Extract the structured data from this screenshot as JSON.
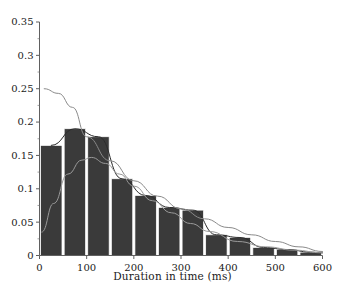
{
  "chart_data": {
    "type": "bar",
    "title": "",
    "xlabel": "Duration in time (ms)",
    "ylabel": "",
    "xlim": [
      0,
      600
    ],
    "ylim": [
      0,
      0.35
    ],
    "grid": false,
    "legend": null,
    "bin_width": 50,
    "x_ticks": [
      0,
      100,
      200,
      300,
      400,
      500,
      600
    ],
    "x_tick_labels": [
      "0",
      "100",
      "200",
      "300",
      "400",
      "500",
      "600"
    ],
    "y_ticks": [
      0,
      0.05,
      0.1,
      0.15,
      0.2,
      0.25,
      0.3,
      0.35
    ],
    "y_tick_labels": [
      "0",
      "0.05",
      "0.1",
      "0.15",
      "0.2",
      "0.25",
      "0.3",
      "0.35"
    ],
    "y_minor_ticks": [
      0.025,
      0.075,
      0.125,
      0.175,
      0.225,
      0.275,
      0.325
    ],
    "categories": [
      "0-50",
      "50-100",
      "100-150",
      "150-200",
      "200-250",
      "250-300",
      "300-350",
      "350-400",
      "400-450",
      "450-500",
      "500-550",
      "550-600"
    ],
    "bin_centers": [
      25,
      75,
      125,
      175,
      225,
      275,
      325,
      375,
      425,
      475,
      525,
      575
    ],
    "values": [
      0.165,
      0.19,
      0.178,
      0.115,
      0.09,
      0.072,
      0.068,
      0.031,
      0.027,
      0.012,
      0.009,
      0.005
    ],
    "bar_color": "#3a3a3a",
    "bar_edge_color": "#ffffff",
    "series": [
      {
        "name": "fit-curve-dark",
        "type": "line",
        "color": "#2b2b2b",
        "x": [
          25,
          75,
          125,
          175,
          225,
          275,
          325,
          375,
          425,
          475,
          525,
          575,
          600
        ],
        "y": [
          0.165,
          0.19,
          0.178,
          0.115,
          0.09,
          0.072,
          0.068,
          0.031,
          0.027,
          0.012,
          0.009,
          0.005,
          0.004
        ]
      },
      {
        "name": "fit-curve-exponential",
        "type": "line",
        "color": "#8a8a8a",
        "x": [
          10,
          40,
          70,
          100,
          150,
          200,
          250,
          300,
          350,
          400,
          450,
          500,
          550,
          600
        ],
        "y": [
          0.25,
          0.243,
          0.222,
          0.178,
          0.142,
          0.112,
          0.089,
          0.07,
          0.055,
          0.042,
          0.031,
          0.021,
          0.013,
          0.006
        ]
      },
      {
        "name": "fit-curve-gamma",
        "type": "line",
        "color": "#9a9a9a",
        "x": [
          5,
          30,
          60,
          90,
          110,
          140,
          170,
          200,
          240,
          280,
          320,
          360,
          420,
          480,
          540,
          600
        ],
        "y": [
          0.035,
          0.078,
          0.122,
          0.143,
          0.147,
          0.138,
          0.122,
          0.104,
          0.082,
          0.064,
          0.048,
          0.036,
          0.021,
          0.013,
          0.008,
          0.004
        ]
      }
    ]
  },
  "axis": {
    "x_axis_name": "x-axis",
    "y_axis_name": "y-axis"
  },
  "caption": {
    "text": "                                                                                                                                     "
  }
}
